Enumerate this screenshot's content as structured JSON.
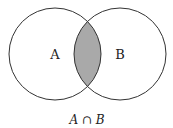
{
  "diagram": {
    "type": "venn",
    "sets": [
      {
        "label": "A"
      },
      {
        "label": "B"
      }
    ],
    "shaded_region": "intersection",
    "caption": "A ∩ B",
    "colors": {
      "stroke": "#333333",
      "shade": "#a9a9a9",
      "background": "#ffffff"
    }
  }
}
